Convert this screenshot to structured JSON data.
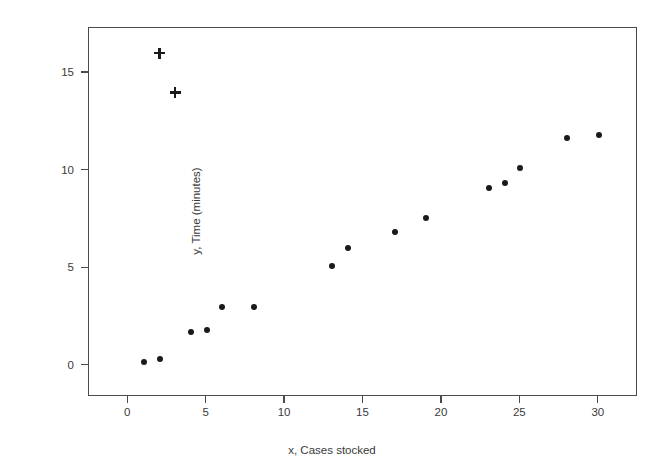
{
  "chart_data": {
    "type": "scatter",
    "title": "",
    "xlabel": "x, Cases stocked",
    "ylabel": "y, Time (minutes)",
    "xlim": [
      -2.5,
      32.5
    ],
    "ylim": [
      -1.6,
      17.3
    ],
    "xticks": [
      0,
      5,
      10,
      15,
      20,
      25,
      30
    ],
    "xticklabels": [
      "0",
      "5",
      "10",
      "15",
      "20",
      "25",
      "30"
    ],
    "yticks": [
      0,
      5,
      10,
      15
    ],
    "yticklabels": [
      "0",
      "5",
      "10",
      "15"
    ],
    "grid": false,
    "legend": false,
    "marker_colors": {
      "dot": "#1a1a1a",
      "cross": "#1a1a1a",
      "frame": "#4a4a4a",
      "background": "#ffffff"
    },
    "series": [
      {
        "name": "observations",
        "marker": "filled-circle",
        "points": [
          {
            "x": 1,
            "y": 0.2
          },
          {
            "x": 2,
            "y": 0.35
          },
          {
            "x": 4,
            "y": 1.75
          },
          {
            "x": 5,
            "y": 1.85
          },
          {
            "x": 6,
            "y": 3.0
          },
          {
            "x": 8,
            "y": 3.0
          },
          {
            "x": 13,
            "y": 5.1
          },
          {
            "x": 14,
            "y": 6.05
          },
          {
            "x": 17,
            "y": 6.85
          },
          {
            "x": 19,
            "y": 7.55
          },
          {
            "x": 23,
            "y": 9.1
          },
          {
            "x": 24,
            "y": 9.35
          },
          {
            "x": 25,
            "y": 10.15
          },
          {
            "x": 28,
            "y": 11.65
          },
          {
            "x": 30,
            "y": 11.8
          }
        ]
      },
      {
        "name": "outliers",
        "marker": "plus",
        "points": [
          {
            "x": 2,
            "y": 16.0
          },
          {
            "x": 3,
            "y": 14.0
          }
        ]
      }
    ]
  }
}
